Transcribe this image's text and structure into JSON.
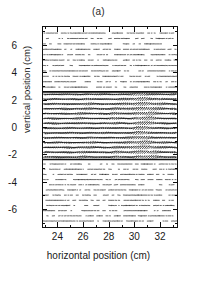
{
  "figure": {
    "panel_label": "(a)",
    "background_color": "#ffffff",
    "ink_color": "#111111"
  },
  "axes": {
    "x_label": "horizontal position (cm)",
    "y_label": "vertical position (cm)",
    "x_ticks": [
      24,
      26,
      28,
      30,
      32
    ],
    "y_ticks": [
      6,
      4,
      2,
      0,
      -2,
      -4,
      -6
    ],
    "x_minor_step": 1,
    "y_minor_step": 1
  },
  "chart_data": {
    "type": "scatter",
    "plot_style": "vector-field-quiver",
    "title": "(a)",
    "xlabel": "horizontal position (cm)",
    "ylabel": "vertical position (cm)",
    "xlim": [
      22.8,
      33.4
    ],
    "ylim": [
      -7.4,
      7.4
    ],
    "x_ticks": [
      24,
      26,
      28,
      30,
      32
    ],
    "y_ticks": [
      6,
      4,
      2,
      0,
      -2,
      -4,
      -6
    ],
    "grid": false,
    "legend": null,
    "annotations": [],
    "zones": [
      {
        "name": "upper-sparse-region",
        "y_range": [
          2.6,
          7.4
        ],
        "arrow_density": "sparse",
        "arrow_length_mean": 0.45,
        "arrow_orientation_deg": 2,
        "description": "short, nearly horizontal dashes in regular rows"
      },
      {
        "name": "central-dense-band",
        "y_range": [
          -2.4,
          2.6
        ],
        "arrow_density": "dense",
        "arrow_length_mean": 1.25,
        "arrow_orientation_deg": 0,
        "description": "long wavy rows of vectors with strong vertical deflection near x=26, x=28.5 and x=30.5"
      },
      {
        "name": "lower-sparse-region",
        "y_range": [
          -7.4,
          -2.4
        ],
        "arrow_density": "sparse",
        "arrow_length_mean": 0.5,
        "arrow_orientation_deg": -2,
        "description": "short dashes in regular rows, mirroring the upper region"
      }
    ],
    "interfaces": [
      {
        "name": "upper-interface",
        "y": 2.6,
        "style": "solid-dark-line"
      },
      {
        "name": "lower-interface",
        "y": -2.4,
        "style": "solid-dark-line"
      }
    ],
    "features": [
      {
        "name": "left-crest",
        "x": 26.1,
        "y": 0.0,
        "type": "wave-crest",
        "amplitude": 0.7
      },
      {
        "name": "mid-crest",
        "x": 28.6,
        "y": 0.0,
        "type": "wave-crest",
        "amplitude": 0.9
      },
      {
        "name": "jet-column",
        "x": 30.6,
        "y": 0.0,
        "type": "vertical-jet",
        "amplitude": 1.6
      },
      {
        "name": "right-crest",
        "x": 31.6,
        "y": 0.0,
        "type": "wave-crest",
        "amplitude": 0.8
      }
    ],
    "grid_spec": {
      "columns": 62,
      "rows_upper": 11,
      "rows_center": 14,
      "rows_lower": 12
    }
  }
}
